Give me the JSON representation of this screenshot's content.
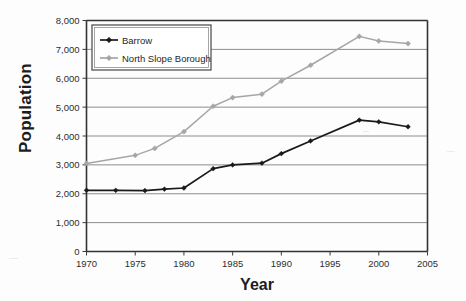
{
  "chart_data": {
    "type": "line",
    "title": "",
    "xlabel": "Year",
    "ylabel": "Population",
    "xlim": [
      1970,
      2005
    ],
    "ylim": [
      0,
      8000
    ],
    "grid": true,
    "legend_position": "top-left-inside",
    "xticks": [
      "1970",
      "1975",
      "1980",
      "1985",
      "1990",
      "1995",
      "2000",
      "2005"
    ],
    "xtick_values": [
      1970,
      1975,
      1980,
      1985,
      1990,
      1995,
      2000,
      2005
    ],
    "yticks": [
      "0",
      "1,000",
      "2,000",
      "3,000",
      "4,000",
      "5,000",
      "6,000",
      "7,000",
      "8,000"
    ],
    "ytick_values": [
      0,
      1000,
      2000,
      3000,
      4000,
      5000,
      6000,
      7000,
      8000
    ],
    "series": [
      {
        "name": "Barrow",
        "color": "#1a1a1a",
        "marker": "diamond",
        "x": [
          1970,
          1973,
          1976,
          1978,
          1980,
          1983,
          1985,
          1988,
          1990,
          1993,
          1998,
          2000,
          2003
        ],
        "values": [
          2120,
          2120,
          2110,
          2160,
          2200,
          2870,
          3000,
          3060,
          3390,
          3830,
          4550,
          4490,
          4320
        ]
      },
      {
        "name": "North Slope Borough",
        "color": "#a6a6a6",
        "marker": "diamond",
        "x": [
          1970,
          1975,
          1977,
          1980,
          1983,
          1985,
          1988,
          1990,
          1993,
          1998,
          2000,
          2003
        ],
        "values": [
          3050,
          3330,
          3570,
          4150,
          5030,
          5330,
          5450,
          5900,
          6450,
          7450,
          7290,
          7200
        ]
      }
    ]
  },
  "axes": {
    "ylabel": "Population",
    "xlabel": "Year"
  },
  "legend": {
    "items": [
      {
        "label": "Barrow"
      },
      {
        "label": "North Slope Borough"
      }
    ]
  }
}
